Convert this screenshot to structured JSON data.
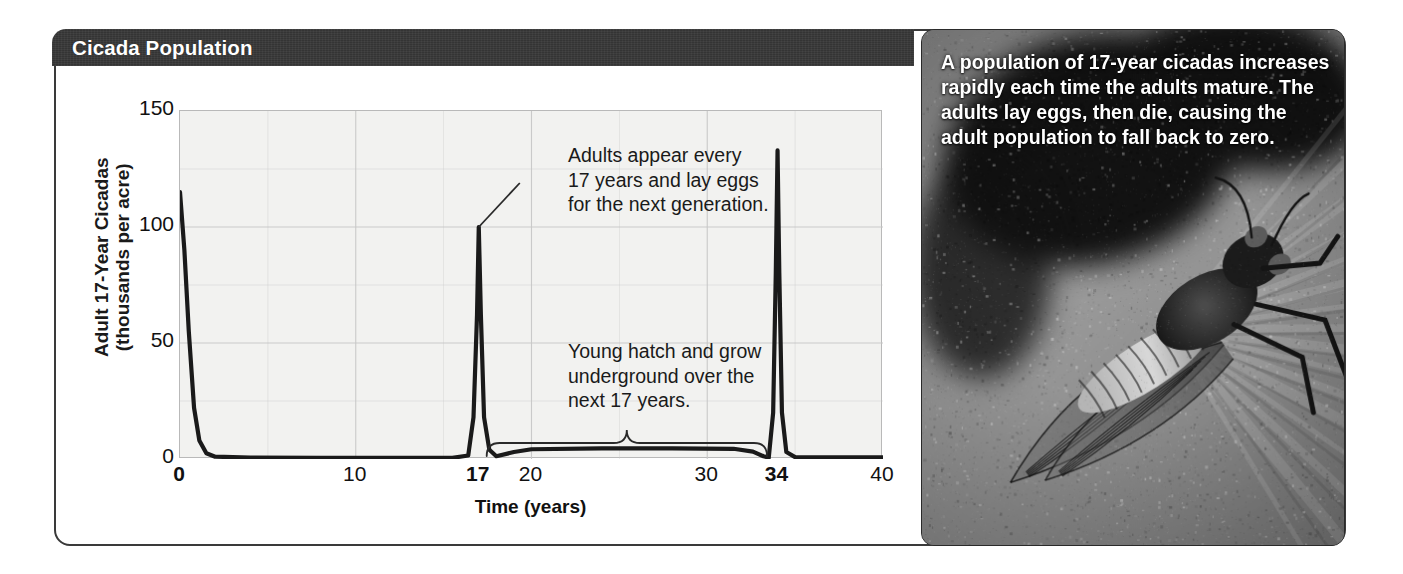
{
  "figure": {
    "title": "Cicada Population"
  },
  "photo": {
    "caption": "A population of 17-year cicadas increases rapidly each time the adults mature. The adults lay eggs, then die, causing the adult population to fall back to zero.",
    "alt_name": "cicada-on-leaf-photograph"
  },
  "annotations": {
    "adults": "Adults appear every\n17 years and lay eggs\nfor the next generation.",
    "young": "Young hatch and grow\nunderground over the\nnext 17 years.",
    "bracket_label": "17-year underground period from year 17 to year 34"
  },
  "colors": {
    "title_bar": "#373737",
    "frame": "#3a3a3a",
    "plot_background": "#f2f2f0",
    "gridline": "#c8c8c8",
    "curve": "#1a1a1a",
    "caption_text": "#ffffff"
  },
  "chart_data": {
    "type": "line",
    "title": "Cicada Population",
    "xlabel": "Time (years)",
    "ylabel": "Adult 17-Year Cicadas\n(thousands per acre)",
    "xlim": [
      0,
      40
    ],
    "ylim": [
      0,
      150
    ],
    "xticks": [
      0,
      10,
      17,
      20,
      30,
      34,
      40
    ],
    "xtick_labels": [
      "0",
      "10",
      "17",
      "20",
      "30",
      "34",
      "40"
    ],
    "xtick_bold": [
      true,
      false,
      true,
      false,
      false,
      true,
      false
    ],
    "yticks": [
      0,
      50,
      100,
      150
    ],
    "ytick_labels": [
      "0",
      "50",
      "100",
      "150"
    ],
    "grid": true,
    "grid_x_step": 5,
    "grid_y_step": 25,
    "legend": "none",
    "series": [
      {
        "name": "Adult 17-year cicadas (thousands per acre)",
        "points": [
          [
            0.0,
            115
          ],
          [
            0.25,
            90
          ],
          [
            0.5,
            55
          ],
          [
            0.8,
            22
          ],
          [
            1.1,
            8
          ],
          [
            1.5,
            2.5
          ],
          [
            2.0,
            1.0
          ],
          [
            4.0,
            0.6
          ],
          [
            8.0,
            0.5
          ],
          [
            12.0,
            0.5
          ],
          [
            15.5,
            0.5
          ],
          [
            16.4,
            1.5
          ],
          [
            16.7,
            18
          ],
          [
            16.9,
            62
          ],
          [
            17.0,
            100
          ],
          [
            17.12,
            62
          ],
          [
            17.3,
            18
          ],
          [
            17.6,
            4
          ],
          [
            18.0,
            1.2
          ],
          [
            19.0,
            3.0
          ],
          [
            20.0,
            4.2
          ],
          [
            24.0,
            4.6
          ],
          [
            28.0,
            4.6
          ],
          [
            31.5,
            4.4
          ],
          [
            32.6,
            3.2
          ],
          [
            33.2,
            1.2
          ],
          [
            33.5,
            0.6
          ],
          [
            33.75,
            20
          ],
          [
            33.9,
            80
          ],
          [
            34.0,
            133
          ],
          [
            34.1,
            80
          ],
          [
            34.25,
            20
          ],
          [
            34.5,
            3
          ],
          [
            35.0,
            0.8
          ],
          [
            36.0,
            0.7
          ],
          [
            40.0,
            0.7
          ]
        ]
      }
    ],
    "peaks": [
      {
        "x": 0,
        "y": 115,
        "note": "initial adult emergence at year 0"
      },
      {
        "x": 17,
        "y": 100,
        "note": "adults appear every 17 years and lay eggs"
      },
      {
        "x": 34,
        "y": 133,
        "note": "next 17-year emergence"
      }
    ]
  }
}
